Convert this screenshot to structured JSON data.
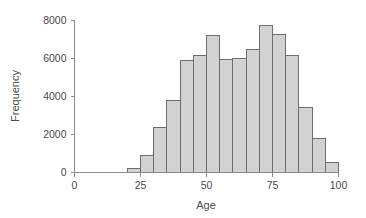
{
  "chart_data": {
    "type": "bar",
    "title": "",
    "subtitle": "",
    "xlabel": "Age",
    "ylabel": "Frequency",
    "xlim": [
      0,
      100
    ],
    "ylim": [
      0,
      8000
    ],
    "grid": false,
    "legend": null,
    "bin_width": 5,
    "categories": [
      "20-25",
      "25-30",
      "30-35",
      "35-40",
      "40-45",
      "45-50",
      "50-55",
      "55-60",
      "60-65",
      "65-70",
      "70-75",
      "75-80",
      "80-85",
      "85-90",
      "90-95",
      "95-100"
    ],
    "bin_starts": [
      20,
      25,
      30,
      35,
      40,
      45,
      50,
      55,
      60,
      65,
      70,
      75,
      80,
      85,
      90,
      95
    ],
    "bin_ends": [
      25,
      30,
      35,
      40,
      45,
      50,
      55,
      60,
      65,
      70,
      75,
      80,
      85,
      90,
      95,
      100
    ],
    "values": [
      200,
      900,
      2350,
      3800,
      5850,
      6150,
      7200,
      5950,
      6000,
      6450,
      7700,
      7250,
      6150,
      3400,
      1800,
      500
    ],
    "x_ticks": [
      0,
      25,
      50,
      75,
      100
    ],
    "x_tick_labels": [
      "0",
      "25",
      "50",
      "75",
      "100"
    ],
    "y_ticks": [
      0,
      2000,
      4000,
      6000,
      8000
    ],
    "y_tick_labels": [
      "0",
      "2000",
      "4000",
      "6000",
      "8000"
    ],
    "bar_fill_color": "#d2d2d2",
    "bar_stroke_color": "#6e6e6e",
    "axis_color": "#8a8a8a",
    "text_color": "#4a4a4a"
  }
}
